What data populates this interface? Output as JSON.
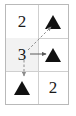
{
  "figure": {
    "background_color": "#ffffff",
    "grid": {
      "rows": 3,
      "columns": 2,
      "border_color": "#b9b9b9",
      "rule_color": "#cfcfcf",
      "highlight_color": "#f2f2f2"
    },
    "cells": [
      {
        "row": 1,
        "col": 1,
        "type": "number",
        "value": "2",
        "highlighted": false,
        "name": "cell-r1c1"
      },
      {
        "row": 1,
        "col": 2,
        "type": "triangle",
        "value": "▲",
        "highlighted": false,
        "name": "cell-r1c2"
      },
      {
        "row": 2,
        "col": 1,
        "type": "number",
        "value": "3",
        "highlighted": true,
        "name": "cell-r2c1"
      },
      {
        "row": 2,
        "col": 2,
        "type": "triangle",
        "value": "▲",
        "highlighted": false,
        "name": "cell-r2c2"
      },
      {
        "row": 3,
        "col": 1,
        "type": "triangle",
        "value": "▲",
        "highlighted": false,
        "name": "cell-r3c1"
      },
      {
        "row": 3,
        "col": 2,
        "type": "number",
        "value": "2",
        "highlighted": false,
        "name": "cell-r3c2"
      }
    ],
    "arrows": [
      {
        "name": "arrow-diagonal-up-right",
        "from_cell": "cell-r2c1",
        "to_cell": "cell-r1c2",
        "direction": "up-right",
        "style": "dashed",
        "color": "#8c8c8c"
      },
      {
        "name": "arrow-right",
        "from_cell": "cell-r2c1",
        "to_cell": "cell-r2c2",
        "direction": "right",
        "style": "solid",
        "color": "#5a5a5a"
      },
      {
        "name": "arrow-down",
        "from_cell": "cell-r2c1",
        "to_cell": "cell-r3c1",
        "direction": "down",
        "style": "dashed",
        "color": "#8c8c8c"
      }
    ]
  }
}
